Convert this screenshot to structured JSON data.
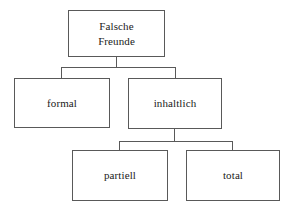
{
  "diagram": {
    "background_color": "#ffffff",
    "line_color": "#595959",
    "text_color": "#1a1a1a",
    "nodes": {
      "root": {
        "line1": "Falsche",
        "line2": "Freunde"
      },
      "formal": {
        "label": "formal"
      },
      "inhaltlich": {
        "label": "inhaltlich"
      },
      "partiell": {
        "label": "partiell"
      },
      "total": {
        "label": "total"
      }
    },
    "edges": [
      {
        "from": "root",
        "to": "formal"
      },
      {
        "from": "root",
        "to": "inhaltlich"
      },
      {
        "from": "inhaltlich",
        "to": "partiell"
      },
      {
        "from": "inhaltlich",
        "to": "total"
      }
    ]
  }
}
